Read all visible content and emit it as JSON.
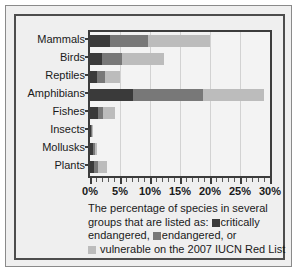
{
  "chart_data": {
    "type": "bar",
    "orientation": "horizontal",
    "stacked": true,
    "title": "",
    "xlabel": "",
    "ylabel": "",
    "xlim": [
      0,
      30
    ],
    "xtick_labels": [
      "0%",
      "5%",
      "10%",
      "15%",
      "20%",
      "25%",
      "30%"
    ],
    "xtick_values": [
      0,
      5,
      10,
      15,
      20,
      25,
      30
    ],
    "xtick_minor_step": 1,
    "grid": true,
    "categories": [
      "Mammals",
      "Birds",
      "Reptiles",
      "Amphibians",
      "Fishes",
      "Insects",
      "Mollusks",
      "Plants"
    ],
    "series": [
      {
        "name": "critically endangered",
        "color": "#3a3a3a",
        "values": [
          3.3,
          2.0,
          1.2,
          7.2,
          1.3,
          0.2,
          0.5,
          0.7
        ]
      },
      {
        "name": "endangered",
        "color": "#787878",
        "values": [
          6.3,
          3.4,
          1.3,
          11.7,
          0.9,
          0.1,
          0.3,
          0.6
        ]
      },
      {
        "name": "vulnerable",
        "color": "#bcbcbc",
        "values": [
          10.4,
          6.9,
          2.5,
          10.1,
          2.0,
          0.1,
          0.3,
          1.6
        ]
      }
    ],
    "totals": [
      20.0,
      12.3,
      5.0,
      29.0,
      4.2,
      0.4,
      1.1,
      2.9
    ],
    "legend_position": "below-caption",
    "caption": {
      "line1": "The percentage of species in several",
      "line2_pre": "groups that are listed as:",
      "line2_legend": "critically",
      "line3_pre": "endangered,",
      "line3_legend": "endangered, or",
      "line4_legend": "vulnerable on the 2007 IUCN Red List"
    }
  },
  "colors": {
    "critical": "#3a3a3a",
    "endangered": "#787878",
    "vulnerable": "#bcbcbc",
    "axis": "#3c3c3c",
    "grid": "#d2d2d2",
    "background": "#efefef",
    "plot_background": "#f3f3f3",
    "frame": "#4d4d4d"
  }
}
